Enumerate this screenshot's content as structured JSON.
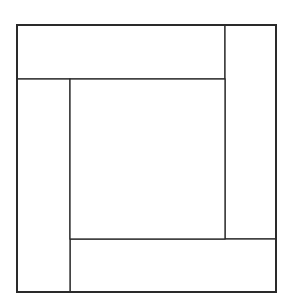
{
  "diagram": {
    "title": "",
    "colors": {
      "stroke": "#2a2a2a",
      "fill": "#ffffff"
    },
    "outer": {
      "x": 17,
      "y": 25,
      "w": 259,
      "h": 267,
      "stroke_width": 2
    },
    "regions": [
      {
        "name": "top-band",
        "x": 17,
        "y": 25,
        "w": 208,
        "h": 54
      },
      {
        "name": "right-column",
        "x": 225,
        "y": 25,
        "w": 51,
        "h": 214
      },
      {
        "name": "bottom-band",
        "x": 70,
        "y": 239,
        "w": 206,
        "h": 53
      },
      {
        "name": "left-column",
        "x": 17,
        "y": 79,
        "w": 53,
        "h": 213
      },
      {
        "name": "center-square",
        "x": 70,
        "y": 79,
        "w": 155,
        "h": 160
      }
    ]
  }
}
